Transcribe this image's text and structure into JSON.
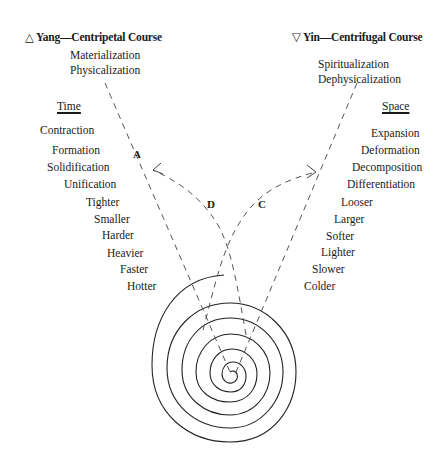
{
  "yang": {
    "symbol": "△",
    "title": "Yang—Centripetal Course",
    "subtitles": [
      "Materialization",
      "Physicalization"
    ],
    "column_header": "Time",
    "words": [
      "Contraction",
      "Formation",
      "Solidification",
      "Unification",
      "Tighter",
      "Smaller",
      "Harder",
      "Heavier",
      "Faster",
      "Hotter"
    ]
  },
  "yin": {
    "symbol": "▽",
    "title": "Yin—Centrifugal Course",
    "subtitles": [
      "Spiritualization",
      "Dephysicalization"
    ],
    "column_header": "Space",
    "words": [
      "Expansion",
      "Deformation",
      "Decomposition",
      "Differentiation",
      "Looser",
      "Larger",
      "Softer",
      "Lighter",
      "Slower",
      "Colder"
    ]
  },
  "path_labels": {
    "a": "A",
    "c": "C",
    "d": "D"
  },
  "colors": {
    "ink": "#1a1a1a",
    "dashed_line": "#555555",
    "background": "#ffffff"
  }
}
